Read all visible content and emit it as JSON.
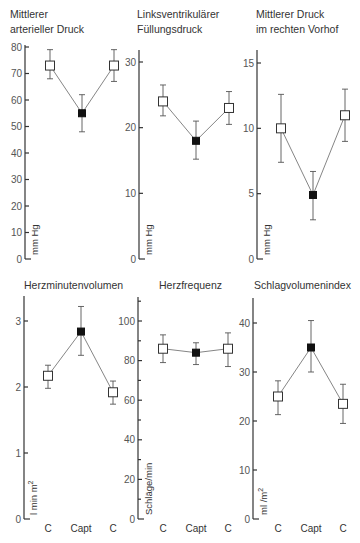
{
  "figure": {
    "width": 360,
    "height": 543
  },
  "chart_data": [
    {
      "type": "line",
      "title": "Mittlerer arterieller Druck",
      "title_lines": [
        "Mittlerer",
        "arterieller Druck"
      ],
      "ylabel": "mm Hg",
      "categories": [
        "C",
        "Capt",
        "C"
      ],
      "show_category_labels": false,
      "values": [
        73,
        55,
        73
      ],
      "error_low": [
        68,
        48,
        67
      ],
      "error_high": [
        79,
        62,
        79
      ],
      "markers": [
        "open",
        "filled",
        "open"
      ],
      "ylim": [
        0,
        80
      ],
      "yticks": [
        0,
        10,
        20,
        30,
        40,
        50,
        60,
        70,
        80
      ],
      "minor_ticks": [],
      "layout": {
        "axis_x": 25,
        "y0_px": 259,
        "ymax_px": 47,
        "axis_top_px": 45,
        "point_x": [
          50,
          82,
          114
        ],
        "title_x": 10,
        "title_y": [
          18,
          33
        ],
        "ylabel_x": 35,
        "ylabel_y": 255
      }
    },
    {
      "type": "line",
      "title": "Linksventrikulärer Füllungsdruck",
      "title_lines": [
        "Linksventrikulärer",
        "Füllungsdruck"
      ],
      "ylabel": "mm Hg",
      "categories": [
        "C",
        "Capt",
        "C"
      ],
      "show_category_labels": false,
      "values": [
        24,
        18,
        23
      ],
      "error_low": [
        21.8,
        15.2,
        20.5
      ],
      "error_high": [
        26.5,
        21,
        25.5
      ],
      "markers": [
        "open",
        "filled",
        "open"
      ],
      "ylim": [
        0,
        30
      ],
      "yticks": [
        0,
        10,
        20,
        30
      ],
      "minor_ticks": [],
      "layout": {
        "axis_x": 139,
        "y0_px": 259,
        "ymax_px": 62,
        "axis_top_px": 50,
        "point_x": [
          163,
          196,
          229
        ],
        "title_x": 137,
        "title_y": [
          18,
          33
        ],
        "ylabel_x": 149,
        "ylabel_y": 255
      }
    },
    {
      "type": "line",
      "title": "Mittlerer Druck im rechten Vorhof",
      "title_lines": [
        "Mittlerer Druck",
        "im rechten Vorhof"
      ],
      "ylabel": "mm Hg",
      "categories": [
        "C",
        "Capt",
        "C"
      ],
      "show_category_labels": false,
      "values": [
        10,
        4.9,
        11
      ],
      "error_low": [
        7.4,
        3,
        9
      ],
      "error_high": [
        12.6,
        6.7,
        13
      ],
      "markers": [
        "open",
        "filled",
        "open"
      ],
      "ylim": [
        0,
        15
      ],
      "yticks": [
        0,
        5,
        10,
        15
      ],
      "minor_ticks": [],
      "layout": {
        "axis_x": 257,
        "y0_px": 259,
        "ymax_px": 63,
        "axis_top_px": 50,
        "point_x": [
          281,
          313,
          345
        ],
        "title_x": 256,
        "title_y": [
          18,
          33
        ],
        "ylabel_x": 267,
        "ylabel_y": 255
      }
    },
    {
      "type": "line",
      "title": "Herzminutenvolumen",
      "title_lines": [
        "Herzminutenvolumen"
      ],
      "ylabel": "l min m²",
      "ylabel_parts": [
        "l min m",
        "2"
      ],
      "categories": [
        "C",
        "Capt",
        "C"
      ],
      "show_category_labels": true,
      "values": [
        2.17,
        2.84,
        1.92
      ],
      "error_low": [
        1.98,
        2.48,
        1.74
      ],
      "error_high": [
        2.33,
        3.22,
        2.09
      ],
      "markers": [
        "open",
        "filled",
        "open"
      ],
      "ylim": [
        0,
        3
      ],
      "yticks": [
        0,
        1,
        2,
        3
      ],
      "minor_ticks": [],
      "layout": {
        "axis_x": 24,
        "y0_px": 519,
        "ymax_px": 321,
        "axis_top_px": 296,
        "point_x": [
          48,
          81,
          113
        ],
        "title_x": 24,
        "title_y": [
          289
        ],
        "ylabel_x": 34,
        "ylabel_y": 515
      }
    },
    {
      "type": "line",
      "title": "Herzfrequenz",
      "title_lines": [
        "Herzfrequenz"
      ],
      "ylabel": "Schläge/min",
      "categories": [
        "C",
        "Capt",
        "C"
      ],
      "show_category_labels": true,
      "values": [
        86,
        84,
        86
      ],
      "error_low": [
        79,
        78,
        77
      ],
      "error_high": [
        93,
        89,
        94
      ],
      "markers": [
        "open",
        "filled",
        "open"
      ],
      "ylim": [
        0,
        100
      ],
      "yticks": [
        0,
        20,
        40,
        60,
        80,
        100
      ],
      "minor_ticks": [
        10,
        30,
        50,
        70,
        90,
        110
      ],
      "layout": {
        "axis_x": 138,
        "y0_px": 519,
        "ymax_px": 321,
        "axis_top_px": 297,
        "point_x": [
          163,
          196,
          228
        ],
        "title_x": 159,
        "title_y": [
          289
        ],
        "ylabel_x": 149,
        "ylabel_y": 515
      }
    },
    {
      "type": "line",
      "title": "Schlagvolumenindex",
      "title_lines": [
        "Schlagvolumenindex"
      ],
      "ylabel": "ml/m²",
      "ylabel_parts": [
        "ml /m",
        "2"
      ],
      "categories": [
        "C",
        "Capt",
        "C"
      ],
      "show_category_labels": true,
      "values": [
        25,
        35,
        23.5
      ],
      "error_low": [
        21.3,
        30,
        19.5
      ],
      "error_high": [
        28.2,
        40.5,
        27.5
      ],
      "markers": [
        "open",
        "filled",
        "open"
      ],
      "ylim": [
        0,
        40
      ],
      "yticks": [
        0,
        10,
        20,
        30,
        40
      ],
      "minor_ticks": [],
      "layout": {
        "axis_x": 253,
        "y0_px": 519,
        "ymax_px": 323,
        "axis_top_px": 298,
        "point_x": [
          278,
          311,
          343
        ],
        "title_x": 254,
        "title_y": [
          289
        ],
        "ylabel_x": 264,
        "ylabel_y": 515
      }
    }
  ],
  "x_category_label_y": 532
}
